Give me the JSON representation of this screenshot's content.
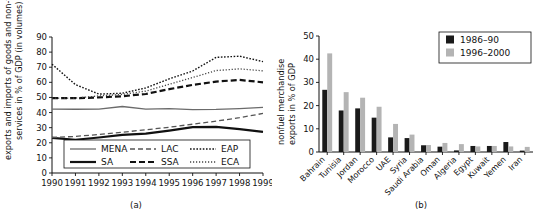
{
  "figure": {
    "panel_a_caption": "(a)",
    "panel_b_caption": "(b)"
  },
  "chart_data": [
    {
      "id": "panel-a",
      "type": "line",
      "title": "",
      "xlabel": "",
      "ylabel": "exports and imports of goods and non-factor services in % of GDP (in volumes)",
      "ylabel_line1": "exports and imports of goods and non-factor",
      "ylabel_line2": "services in % of GDP (in volumes)",
      "x": [
        1990,
        1991,
        1992,
        1993,
        1994,
        1995,
        1996,
        1997,
        1998,
        1999
      ],
      "xticklabels": [
        "1990",
        "1991",
        "1992",
        "1993",
        "1994",
        "1995",
        "1996",
        "1997",
        "1998",
        "1999"
      ],
      "yticklabels": [
        "0",
        "10",
        "20",
        "30",
        "40",
        "50",
        "60",
        "70",
        "80",
        "90"
      ],
      "ylim": [
        0,
        90
      ],
      "ytick_step": 10,
      "grid": false,
      "legend_position": "inside-bottom",
      "series": [
        {
          "name": "MENA",
          "style": "solid-thin",
          "color": "#6b6b6b",
          "width": 1.3,
          "dash": "none",
          "values": [
            42.3,
            42.2,
            42.3,
            44.0,
            42.3,
            42.6,
            42.0,
            42.1,
            42.6,
            43.4
          ]
        },
        {
          "name": "SA",
          "style": "solid-thick",
          "color": "#111111",
          "width": 2.2,
          "dash": "none",
          "values": [
            23.3,
            22.0,
            23.5,
            25.2,
            26.0,
            28.0,
            30.3,
            30.5,
            29.0,
            27.2
          ]
        },
        {
          "name": "LAC",
          "style": "dash-long",
          "color": "#555555",
          "width": 1.3,
          "dash": "5,3",
          "values": [
            23.5,
            24.2,
            25.5,
            27.0,
            28.6,
            30.3,
            32.3,
            34.3,
            36.6,
            39.4
          ]
        },
        {
          "name": "SSA",
          "style": "dash-heavy",
          "color": "#111111",
          "width": 2.2,
          "dash": "6,3",
          "values": [
            49.5,
            49.5,
            50.0,
            50.8,
            52.3,
            55.5,
            58.3,
            60.5,
            61.6,
            60.0
          ]
        },
        {
          "name": "EAP",
          "style": "dot-dense",
          "color": "#111111",
          "width": 1.4,
          "dash": "1.6,1.6",
          "values": [
            72.0,
            58.5,
            52.2,
            52.8,
            56.3,
            62.3,
            67.5,
            76.5,
            77.3,
            73.7
          ]
        },
        {
          "name": "ECA",
          "style": "dot-fine",
          "color": "#444444",
          "width": 1.3,
          "dash": "1.2,1.8",
          "values": [
            49.5,
            49.6,
            51.0,
            52.0,
            54.2,
            58.7,
            63.2,
            67.8,
            68.9,
            67.6
          ]
        }
      ],
      "legend": [
        {
          "name": "MENA"
        },
        {
          "name": "LAC"
        },
        {
          "name": "EAP"
        },
        {
          "name": "SA"
        },
        {
          "name": "SSA"
        },
        {
          "name": "ECA"
        }
      ]
    },
    {
      "id": "panel-b",
      "type": "bar",
      "title": "",
      "xlabel": "",
      "ylabel": "nonfuel merchandise exports in % of GDP",
      "ylabel_line1": "nonfuel merchandise",
      "ylabel_line2": "exports in % of GDP",
      "categories": [
        "Bahrain",
        "Tunisia",
        "Jordan",
        "Morocco",
        "UAE",
        "Syria",
        "Saudi Arabia",
        "Oman",
        "Algeria",
        "Egypt",
        "Kuwait",
        "Yemen",
        "Iran"
      ],
      "yticklabels": [
        "0",
        "10",
        "20",
        "30",
        "40",
        "50"
      ],
      "ylim": [
        0,
        50
      ],
      "ytick_step": 10,
      "grid": false,
      "legend_position": "top-right",
      "series": [
        {
          "name": "1986–90",
          "color": "#1a1a1a",
          "values": [
            26.8,
            17.9,
            18.8,
            14.8,
            6.3,
            6.0,
            2.9,
            2.3,
            0.7,
            2.6,
            2.6,
            4.3,
            0.6
          ]
        },
        {
          "name": "1996–2000",
          "color": "#b4b4b4",
          "values": [
            42.5,
            25.8,
            23.4,
            19.5,
            12.1,
            7.5,
            3.0,
            3.9,
            3.4,
            2.4,
            2.6,
            2.4,
            2.2
          ]
        }
      ]
    }
  ]
}
